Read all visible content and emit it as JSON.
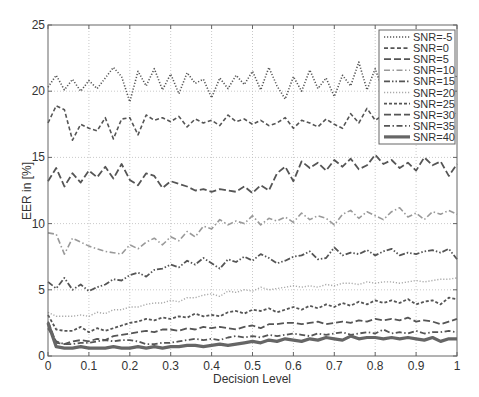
{
  "chart_data": {
    "type": "line",
    "title": "",
    "xlabel": "Decision Level",
    "ylabel": "EER in [%]",
    "xlim": [
      0,
      1
    ],
    "ylim": [
      0,
      25
    ],
    "xticks": [
      0,
      0.1,
      0.2,
      0.3,
      0.4,
      0.5,
      0.6,
      0.7,
      0.8,
      0.9,
      1
    ],
    "xtick_labels": [
      "0",
      "0.1",
      "0.2",
      "0.3",
      "0.4",
      "0.5",
      "0.6",
      "0.7",
      "0.8",
      "0.9",
      "1"
    ],
    "yticks": [
      0,
      5,
      10,
      15,
      20,
      25
    ],
    "ytick_labels": [
      "0",
      "5",
      "10",
      "15",
      "20",
      "25"
    ],
    "grid": true,
    "legend_position": "upper right",
    "x": [
      0,
      0.02,
      0.04,
      0.06,
      0.08,
      0.1,
      0.12,
      0.14,
      0.16,
      0.18,
      0.2,
      0.22,
      0.24,
      0.26,
      0.28,
      0.3,
      0.32,
      0.34,
      0.36,
      0.38,
      0.4,
      0.42,
      0.44,
      0.46,
      0.48,
      0.5,
      0.52,
      0.54,
      0.56,
      0.58,
      0.6,
      0.62,
      0.64,
      0.66,
      0.68,
      0.7,
      0.72,
      0.74,
      0.76,
      0.78,
      0.8,
      0.82,
      0.84,
      0.86,
      0.88,
      0.9,
      0.92,
      0.94,
      0.96,
      0.98,
      1
    ],
    "series": [
      {
        "name": "SNR=-5",
        "style": "dotted",
        "color": "#555555",
        "width": 1.6,
        "values": [
          20.3,
          21.2,
          20.1,
          20.9,
          20.0,
          20.8,
          20.2,
          21.0,
          21.8,
          21.1,
          19.2,
          21.5,
          20.4,
          21.7,
          20.1,
          21.3,
          19.8,
          21.4,
          20.6,
          20.9,
          19.5,
          21.0,
          20.2,
          21.2,
          20.5,
          21.5,
          20.1,
          21.8,
          20.4,
          19.4,
          21.1,
          20.0,
          21.6,
          20.2,
          21.0,
          19.6,
          21.2,
          20.4,
          22.2,
          20.1,
          21.7,
          19.9,
          21.3,
          20.6,
          21.8,
          20.0,
          21.4,
          20.3,
          21.9,
          20.5,
          21.2
        ]
      },
      {
        "name": "SNR=0",
        "style": "dashed",
        "color": "#555555",
        "width": 1.6,
        "values": [
          17.6,
          18.9,
          18.6,
          16.3,
          17.5,
          17.2,
          17.0,
          18.0,
          16.4,
          17.9,
          18.0,
          16.7,
          18.2,
          17.8,
          18.0,
          17.7,
          18.1,
          17.3,
          17.9,
          17.6,
          17.8,
          17.4,
          18.2,
          17.7,
          17.9,
          17.5,
          17.8,
          17.4,
          17.6,
          18.0,
          17.2,
          17.8,
          17.6,
          17.3,
          17.9,
          17.5,
          17.2,
          18.3,
          17.6,
          18.7,
          17.8,
          18.2,
          17.6,
          18.0,
          17.4,
          18.3,
          17.8,
          18.5,
          18.0,
          18.6,
          18.2
        ]
      },
      {
        "name": "SNR=5",
        "style": "longdash",
        "color": "#555555",
        "width": 1.8,
        "values": [
          13.2,
          14.2,
          12.8,
          13.8,
          13.1,
          14.0,
          13.5,
          14.3,
          13.4,
          14.5,
          13.3,
          12.9,
          13.8,
          13.6,
          12.7,
          13.2,
          13.0,
          12.8,
          12.5,
          12.6,
          12.4,
          12.6,
          12.5,
          12.4,
          12.8,
          12.3,
          12.9,
          12.5,
          13.8,
          14.3,
          13.2,
          14.7,
          14.2,
          14.6,
          14.0,
          14.8,
          14.3,
          14.9,
          14.1,
          14.4,
          15.2,
          14.5,
          14.8,
          14.2,
          14.6,
          14.0,
          15.0,
          14.4,
          14.7,
          13.6,
          14.5
        ]
      },
      {
        "name": "SNR=10",
        "style": "dashdot",
        "color": "#999999",
        "width": 1.6,
        "values": [
          9.3,
          9.2,
          7.7,
          8.9,
          8.6,
          8.3,
          8.1,
          7.9,
          7.8,
          7.7,
          8.4,
          8.1,
          8.6,
          8.9,
          8.4,
          9.0,
          8.7,
          9.4,
          9.0,
          9.8,
          9.6,
          10.3,
          9.9,
          10.2,
          10.0,
          10.6,
          9.9,
          10.4,
          10.2,
          10.5,
          10.1,
          10.8,
          10.3,
          10.6,
          10.4,
          9.9,
          10.7,
          11.0,
          10.4,
          10.9,
          10.6,
          10.3,
          10.9,
          11.2,
          10.5,
          10.8,
          10.3,
          10.9,
          10.7,
          11.0,
          10.7
        ]
      },
      {
        "name": "SNR=15",
        "style": "dashdotdot",
        "color": "#555555",
        "width": 1.8,
        "values": [
          5.6,
          5.1,
          5.9,
          5.0,
          5.4,
          4.9,
          5.2,
          5.4,
          5.8,
          5.7,
          6.1,
          6.3,
          6.0,
          6.5,
          6.6,
          6.9,
          6.7,
          7.2,
          6.9,
          7.4,
          7.0,
          6.6,
          7.3,
          7.1,
          7.5,
          7.2,
          7.7,
          7.4,
          7.0,
          7.2,
          7.5,
          7.6,
          7.9,
          7.3,
          7.4,
          8.2,
          7.6,
          7.8,
          7.7,
          8.0,
          7.6,
          7.9,
          8.1,
          7.6,
          7.8,
          7.7,
          7.9,
          8.0,
          7.8,
          8.1,
          7.3
        ]
      },
      {
        "name": "SNR=20",
        "style": "dotted",
        "color": "#aaaaaa",
        "width": 1.4,
        "values": [
          3.3,
          3.0,
          3.0,
          3.0,
          3.1,
          3.0,
          3.3,
          3.2,
          3.5,
          3.5,
          3.7,
          3.7,
          3.9,
          4.0,
          4.0,
          4.2,
          4.1,
          4.4,
          4.4,
          4.6,
          4.7,
          4.5,
          4.9,
          4.8,
          5.0,
          4.9,
          5.2,
          5.0,
          5.1,
          5.2,
          5.3,
          5.2,
          5.3,
          5.2,
          5.4,
          5.3,
          5.5,
          5.5,
          5.4,
          5.6,
          5.5,
          5.6,
          5.6,
          5.5,
          5.6,
          5.7,
          5.6,
          5.7,
          5.8,
          5.8,
          5.9
        ]
      },
      {
        "name": "SNR=25",
        "style": "shortdash",
        "color": "#555555",
        "width": 1.8,
        "values": [
          3.1,
          2.0,
          1.9,
          1.9,
          2.2,
          1.8,
          2.1,
          1.9,
          2.1,
          2.3,
          2.5,
          2.6,
          2.8,
          2.7,
          2.9,
          2.8,
          3.0,
          2.9,
          3.2,
          3.0,
          3.1,
          3.0,
          3.3,
          3.4,
          3.2,
          3.5,
          3.4,
          3.6,
          3.3,
          3.5,
          3.7,
          3.5,
          3.8,
          3.6,
          3.9,
          3.7,
          4.0,
          3.8,
          4.1,
          3.9,
          4.2,
          4.0,
          4.2,
          4.0,
          4.3,
          3.9,
          4.1,
          4.2,
          3.9,
          4.4,
          4.3
        ]
      },
      {
        "name": "SNR=30",
        "style": "longdash",
        "color": "#555555",
        "width": 1.8,
        "values": [
          2.6,
          1.0,
          0.9,
          1.1,
          1.2,
          1.1,
          1.3,
          1.2,
          1.5,
          1.6,
          1.7,
          1.8,
          1.9,
          1.8,
          2.0,
          2.0,
          1.9,
          2.1,
          2.0,
          2.2,
          2.1,
          2.2,
          2.1,
          2.0,
          2.2,
          2.3,
          2.1,
          2.4,
          2.4,
          2.5,
          2.5,
          2.4,
          2.5,
          2.6,
          2.4,
          2.5,
          2.6,
          2.5,
          2.7,
          2.6,
          2.8,
          2.7,
          2.8,
          2.7,
          2.9,
          2.6,
          2.7,
          2.6,
          2.4,
          2.6,
          2.8
        ]
      },
      {
        "name": "SNR=35",
        "style": "dashdot",
        "color": "#555555",
        "width": 1.8,
        "values": [
          2.1,
          1.1,
          0.9,
          0.9,
          1.0,
          1.0,
          1.1,
          1.2,
          1.1,
          1.2,
          1.2,
          1.1,
          0.9,
          0.9,
          1.0,
          1.0,
          1.1,
          1.2,
          1.3,
          1.2,
          1.3,
          1.2,
          1.4,
          1.5,
          1.4,
          1.5,
          1.4,
          1.6,
          1.5,
          1.6,
          1.7,
          1.6,
          1.5,
          1.7,
          1.6,
          1.7,
          1.8,
          1.6,
          1.7,
          1.8,
          1.7,
          2.0,
          1.7,
          1.8,
          1.7,
          1.9,
          1.7,
          1.8,
          1.8,
          1.9,
          1.8
        ]
      },
      {
        "name": "SNR=40",
        "style": "solid",
        "color": "#666666",
        "width": 3.2,
        "values": [
          2.5,
          0.7,
          0.6,
          0.6,
          0.7,
          0.6,
          0.6,
          0.6,
          0.7,
          0.6,
          0.6,
          0.7,
          0.6,
          0.7,
          0.6,
          0.7,
          0.7,
          0.8,
          0.8,
          0.7,
          0.8,
          0.9,
          0.8,
          0.9,
          1.0,
          1.1,
          1.0,
          1.2,
          1.1,
          1.3,
          1.2,
          1.1,
          1.3,
          1.2,
          1.4,
          1.3,
          1.2,
          1.5,
          1.3,
          1.4,
          1.4,
          1.3,
          1.4,
          1.3,
          1.4,
          1.3,
          1.2,
          1.4,
          1.1,
          1.3,
          1.3
        ]
      }
    ]
  }
}
